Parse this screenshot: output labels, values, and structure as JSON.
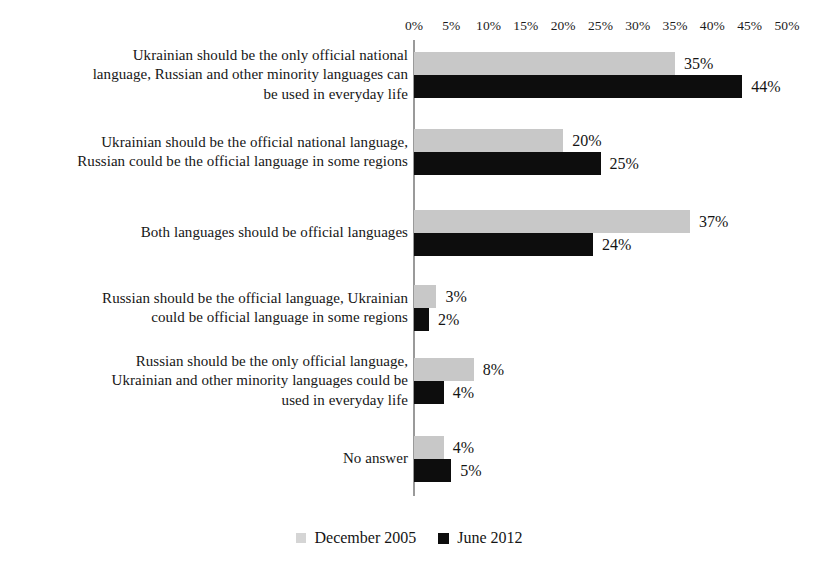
{
  "chart_data": {
    "type": "bar",
    "orientation": "horizontal",
    "title": "",
    "xlabel": "",
    "ylabel": "",
    "xlim": [
      0,
      50
    ],
    "xticks": [
      "0%",
      "5%",
      "10%",
      "15%",
      "20%",
      "25%",
      "30%",
      "35%",
      "40%",
      "45%",
      "50%"
    ],
    "xtick_values": [
      0,
      5,
      10,
      15,
      20,
      25,
      30,
      35,
      40,
      45,
      50
    ],
    "grid": false,
    "legend_position": "bottom-center",
    "value_suffix": "%",
    "categories": [
      "Ukrainian should be the only official national language, Russian and other minority languages can be used in everyday life",
      "Ukrainian should be the official national language, Russian could be the official language in some regions",
      "Both languages should be official languages",
      "Russian should be the official language, Ukrainian could be official language in some regions",
      "Russian should be the only official language, Ukrainian and other minority languages could be used in everyday life",
      "No answer"
    ],
    "series": [
      {
        "name": "December 2005",
        "color": "#c8c8c8",
        "values": [
          35,
          20,
          37,
          3,
          8,
          4
        ],
        "labels": [
          "35%",
          "20%",
          "37%",
          "3%",
          "8%",
          "4%"
        ]
      },
      {
        "name": "June 2012",
        "color": "#0d0d0d",
        "values": [
          44,
          25,
          24,
          2,
          4,
          5
        ],
        "labels": [
          "44%",
          "25%",
          "24%",
          "2%",
          "4%",
          "5%"
        ]
      }
    ]
  },
  "category_lines": [
    [
      "Ukrainian should be the only official national",
      "language, Russian and other minority languages can",
      "be used in everyday life"
    ],
    [
      "Ukrainian should be the official national language,",
      "Russian could be the official language in some regions"
    ],
    [
      "Both languages should be official languages"
    ],
    [
      "Russian should be the official language, Ukrainian",
      "could be official language in some regions"
    ],
    [
      "Russian should be the only official language,",
      "Ukrainian and other minority languages could be",
      "used in everyday life"
    ],
    [
      "No answer"
    ]
  ],
  "colors": {
    "background": "#ffffff",
    "axis": "#9a9a9a",
    "series_december_2005": "#c8c8c8",
    "series_june_2012": "#0d0d0d",
    "text": "#161616"
  }
}
